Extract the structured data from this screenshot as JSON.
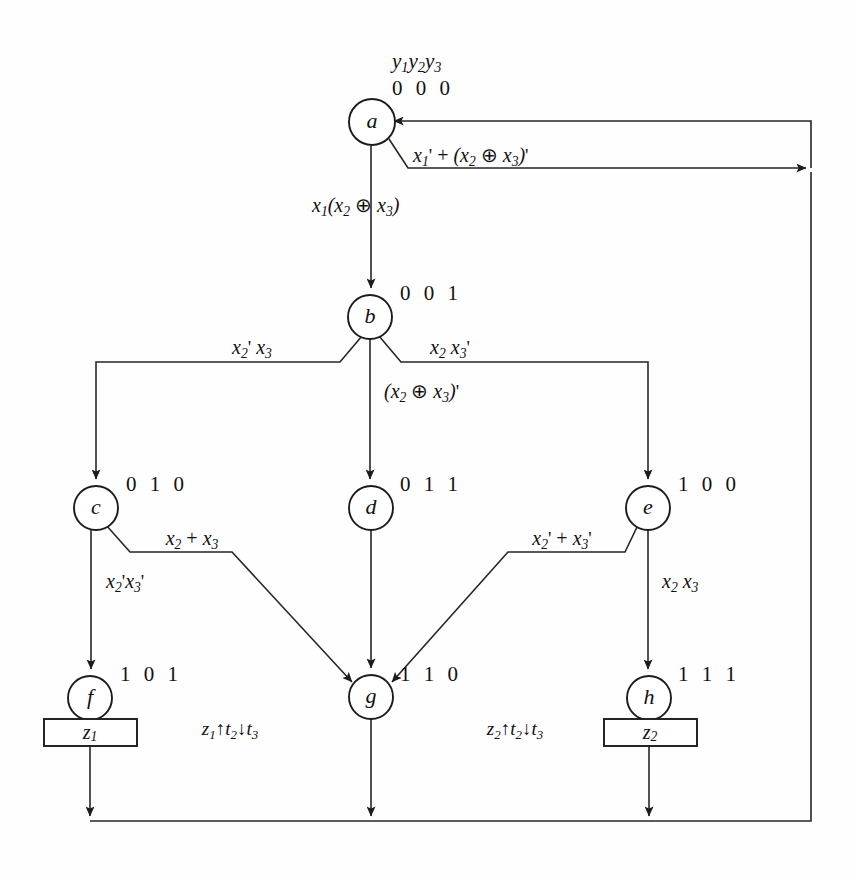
{
  "diagram": {
    "type": "asm-state-diagram",
    "title_vars": "y1y2y3",
    "stroke_color": "#262626",
    "background": "#fefefe",
    "states": [
      {
        "id": "a",
        "label": "a",
        "code": "0 0 0",
        "cx": 372,
        "cy": 122,
        "r": 23,
        "output": null
      },
      {
        "id": "b",
        "label": "b",
        "code": "0 0 1",
        "cx": 370,
        "cy": 317,
        "r": 22,
        "output": null
      },
      {
        "id": "c",
        "label": "c",
        "code": "0 1 0",
        "cx": 96,
        "cy": 508,
        "r": 22,
        "output": null
      },
      {
        "id": "d",
        "label": "d",
        "code": "0 1 1",
        "cx": 371,
        "cy": 508,
        "r": 22,
        "output": null
      },
      {
        "id": "e",
        "label": "e",
        "code": "1 0 0",
        "cx": 648,
        "cy": 508,
        "r": 22,
        "output": null
      },
      {
        "id": "f",
        "label": "f",
        "code": "1 0 1",
        "cx": 90,
        "cy": 698,
        "r": 22,
        "output": "z1"
      },
      {
        "id": "g",
        "label": "g",
        "code": "1 1 0",
        "cx": 371,
        "cy": 697,
        "r": 22,
        "output": null
      },
      {
        "id": "h",
        "label": "h",
        "code": "1 1 1",
        "cx": 649,
        "cy": 698,
        "r": 22,
        "output": "z2"
      }
    ],
    "output_boxes": [
      {
        "id": "z1-box",
        "label": "z1",
        "state": "f",
        "x": 44,
        "y": 719,
        "w": 93,
        "h": 27
      },
      {
        "id": "z2-box",
        "label": "z2",
        "state": "h",
        "x": 604,
        "y": 719,
        "w": 93,
        "h": 27
      }
    ],
    "transitions": [
      {
        "from": "a",
        "to": "a",
        "label": "x1' + (x2 ⊕ x3)'",
        "kind": "self-loop-right"
      },
      {
        "from": "a",
        "to": "b",
        "label": "x1(x2 ⊕ x3)",
        "kind": "vertical"
      },
      {
        "from": "b",
        "to": "c",
        "label": "x2' x3",
        "kind": "left-branch"
      },
      {
        "from": "b",
        "to": "d",
        "label": "(x2 ⊕ x3)'",
        "kind": "vertical"
      },
      {
        "from": "b",
        "to": "e",
        "label": "x2 x3'",
        "kind": "right-branch"
      },
      {
        "from": "c",
        "to": "f",
        "label": "x2'x3'",
        "kind": "vertical"
      },
      {
        "from": "c",
        "to": "g",
        "label": "x2 + x3",
        "kind": "diagonal-right"
      },
      {
        "from": "d",
        "to": "g",
        "label": "",
        "kind": "vertical"
      },
      {
        "from": "e",
        "to": "g",
        "label": "x2' + x3'",
        "kind": "diagonal-left"
      },
      {
        "from": "e",
        "to": "h",
        "label": "x2 x3",
        "kind": "vertical"
      },
      {
        "from": "f",
        "to": "a",
        "label": "",
        "kind": "return-bottom"
      },
      {
        "from": "g",
        "to": "a",
        "label": "",
        "kind": "return-bottom"
      },
      {
        "from": "h",
        "to": "a",
        "label": "",
        "kind": "return-bottom"
      }
    ],
    "actions": [
      {
        "id": "action-z1",
        "text": "z1↑t2↓t3",
        "near_state": "f"
      },
      {
        "id": "action-z2",
        "text": "z2↑t2↓t3",
        "near_state": "h"
      }
    ]
  }
}
